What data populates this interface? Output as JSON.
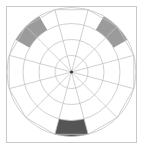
{
  "chart_data": {
    "type": "pie",
    "title": "",
    "subtitle": "",
    "xlabel": "",
    "ylabel": "",
    "grid": true,
    "legend_position": "none",
    "coordinate_system": "polar",
    "center": {
      "x": 71.5,
      "y": 72.0
    },
    "spoke_count": 12,
    "sector_width_degrees": 30,
    "ring_count": 4,
    "ring_radii": [
      16.5,
      32.5,
      48.5,
      64.5
    ],
    "ring_labels": [
      "1",
      "2",
      "3",
      "4"
    ],
    "rlim": [
      0,
      4
    ],
    "theta_zero_location": "E",
    "theta_direction": "counterclockwise",
    "categories": [
      "0-30",
      "30-60",
      "60-90",
      "90-120",
      "120-150",
      "150-180",
      "180-210",
      "210-240",
      "240-270",
      "270-300",
      "300-330",
      "330-360"
    ],
    "values": [
      0,
      1,
      0,
      0,
      1,
      0,
      0,
      0,
      0,
      1,
      0,
      0
    ],
    "series": [
      {
        "name": "highlighted-sectors",
        "values": [
          0,
          1,
          0,
          0,
          1,
          0,
          0,
          0,
          0,
          1,
          0,
          0
        ]
      }
    ],
    "highlighted_sectors": [
      {
        "name": "upper-right-sector",
        "start_angle_deg": 30,
        "end_angle_deg": 60,
        "inner_radius": 48.5,
        "outer_radius": 64.5,
        "ring_band": "3-4",
        "value": 1,
        "color": "#9b9b9b"
      },
      {
        "name": "upper-left-sector",
        "start_angle_deg": 120,
        "end_angle_deg": 150,
        "inner_radius": 48.5,
        "outer_radius": 64.5,
        "ring_band": "3-4",
        "value": 1,
        "color": "#9b9b9b"
      },
      {
        "name": "bottom-sector",
        "start_angle_deg": 255,
        "end_angle_deg": 285,
        "inner_radius": 48.5,
        "outer_radius": 64.5,
        "ring_band": "3-4",
        "value": 1,
        "color": "#555555"
      }
    ],
    "annotations": []
  },
  "style": {
    "background_color": "#ffffff",
    "frame_border_color": "#c8c8c8",
    "grid_color": "#c4c4c4",
    "spoke_color": "#c4c4c4",
    "center_dot_color": "#3a3a3a",
    "highlight_mid_gray": "#9b9b9b",
    "highlight_dark_gray": "#555555"
  },
  "canvas": {
    "width": 143,
    "height": 149
  }
}
